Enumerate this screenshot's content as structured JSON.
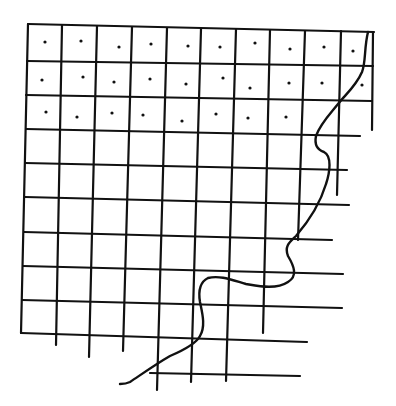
{
  "drawing": {
    "description": "Hand-drawn grid with dotted cells in the top three rows and a wavy boundary curve on the right side",
    "colors": {
      "ink": "#111111",
      "background": "#ffffff"
    },
    "horizontal_lines": [
      {
        "y1": 24,
        "y2": 32,
        "x1": 28,
        "x2": 374
      },
      {
        "y1": 61,
        "y2": 66,
        "x1": 27,
        "x2": 373
      },
      {
        "y1": 95,
        "y2": 101,
        "x1": 26,
        "x2": 372
      },
      {
        "y1": 129,
        "y2": 136,
        "x1": 26,
        "x2": 360
      },
      {
        "y1": 163,
        "y2": 170,
        "x1": 25,
        "x2": 347
      },
      {
        "y1": 197,
        "y2": 205,
        "x1": 25,
        "x2": 349
      },
      {
        "y1": 232,
        "y2": 240,
        "x1": 24,
        "x2": 332
      },
      {
        "y1": 266,
        "y2": 274,
        "x1": 23,
        "x2": 343
      },
      {
        "y1": 300,
        "y2": 308,
        "x1": 22,
        "x2": 342
      },
      {
        "y1": 333,
        "y2": 342,
        "x1": 21,
        "x2": 307
      },
      {
        "y1": 373,
        "y2": 376,
        "x1": 150,
        "x2": 300
      }
    ],
    "vertical_lines": [
      {
        "x1": 28,
        "x2": 21,
        "y1": 24,
        "y2": 333
      },
      {
        "x1": 62,
        "x2": 56,
        "y1": 25,
        "y2": 345
      },
      {
        "x1": 97,
        "x2": 89,
        "y1": 26,
        "y2": 357
      },
      {
        "x1": 132,
        "x2": 123,
        "y1": 27,
        "y2": 351
      },
      {
        "x1": 167,
        "x2": 157,
        "y1": 28,
        "y2": 390
      },
      {
        "x1": 201,
        "x2": 191,
        "y1": 29,
        "y2": 382
      },
      {
        "x1": 236,
        "x2": 226,
        "y1": 29,
        "y2": 381
      },
      {
        "x1": 270,
        "x2": 263,
        "y1": 30,
        "y2": 333
      },
      {
        "x1": 305,
        "x2": 298,
        "y1": 31,
        "y2": 240
      },
      {
        "x1": 341,
        "x2": 337,
        "y1": 31,
        "y2": 195
      },
      {
        "x1": 373,
        "x2": 372,
        "y1": 32,
        "y2": 130
      }
    ],
    "dots": [
      {
        "x": 45,
        "y": 42
      },
      {
        "x": 81,
        "y": 41
      },
      {
        "x": 119,
        "y": 47
      },
      {
        "x": 151,
        "y": 44
      },
      {
        "x": 188,
        "y": 46
      },
      {
        "x": 220,
        "y": 47
      },
      {
        "x": 255,
        "y": 43
      },
      {
        "x": 290,
        "y": 49
      },
      {
        "x": 324,
        "y": 47
      },
      {
        "x": 353,
        "y": 51
      },
      {
        "x": 42,
        "y": 80
      },
      {
        "x": 83,
        "y": 77
      },
      {
        "x": 114,
        "y": 82
      },
      {
        "x": 150,
        "y": 79
      },
      {
        "x": 186,
        "y": 84
      },
      {
        "x": 223,
        "y": 78
      },
      {
        "x": 250,
        "y": 88
      },
      {
        "x": 289,
        "y": 83
      },
      {
        "x": 322,
        "y": 83
      },
      {
        "x": 362,
        "y": 85
      },
      {
        "x": 46,
        "y": 112
      },
      {
        "x": 77,
        "y": 117
      },
      {
        "x": 112,
        "y": 113
      },
      {
        "x": 143,
        "y": 115
      },
      {
        "x": 182,
        "y": 121
      },
      {
        "x": 216,
        "y": 114
      },
      {
        "x": 248,
        "y": 118
      },
      {
        "x": 286,
        "y": 117
      }
    ],
    "curve_path": "M368,32 C364,48 366,62 362,72 C356,86 346,94 338,104 C330,114 320,124 316,136 C314,146 318,150 324,152 C332,156 330,172 326,184 C320,204 308,222 296,236 C290,242 284,246 288,256 C294,266 298,276 288,282 C276,290 258,286 246,284 C232,280 220,275 208,278 C200,282 198,290 200,302 C202,312 206,326 200,336 C196,344 184,350 170,356 C156,364 142,374 130,382 C126,384 122,384 120,384"
  }
}
